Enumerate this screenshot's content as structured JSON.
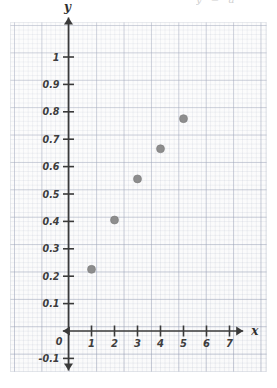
{
  "header": {
    "clipped_text": "y = a"
  },
  "chart_data": {
    "type": "scatter",
    "title": "",
    "xlabel": "x",
    "ylabel": "y",
    "x": [
      1,
      2,
      3,
      4,
      5
    ],
    "values": [
      0.225,
      0.405,
      0.555,
      0.665,
      0.775
    ],
    "points": [
      {
        "x": 1,
        "y": 0.225
      },
      {
        "x": 2,
        "y": 0.405
      },
      {
        "x": 3,
        "y": 0.555
      },
      {
        "x": 4,
        "y": 0.665
      },
      {
        "x": 5,
        "y": 0.775
      }
    ],
    "xlim": [
      -0.55,
      7.9
    ],
    "ylim": [
      -0.17,
      1.17
    ],
    "xticks": [
      1,
      2,
      3,
      4,
      5,
      6,
      7
    ],
    "xtick_labels": [
      "1",
      "2",
      "3",
      "4",
      "5",
      "6",
      "7"
    ],
    "yticks": [
      -0.1,
      0.1,
      0.2,
      0.3,
      0.4,
      0.5,
      0.6,
      0.7,
      0.8,
      0.9,
      1
    ],
    "ytick_labels": [
      "-0.1",
      "0.1",
      "0.2",
      "0.3",
      "0.4",
      "0.5",
      "0.6",
      "0.7",
      "0.8",
      "0.9",
      "1"
    ],
    "origin_label": "0",
    "grid": true,
    "grid_style": "graph-paper",
    "legend": "none",
    "marker_color": "#8d8d8d",
    "axis_color": "#3a3a3a",
    "paper_color": "#fbfbfb"
  }
}
